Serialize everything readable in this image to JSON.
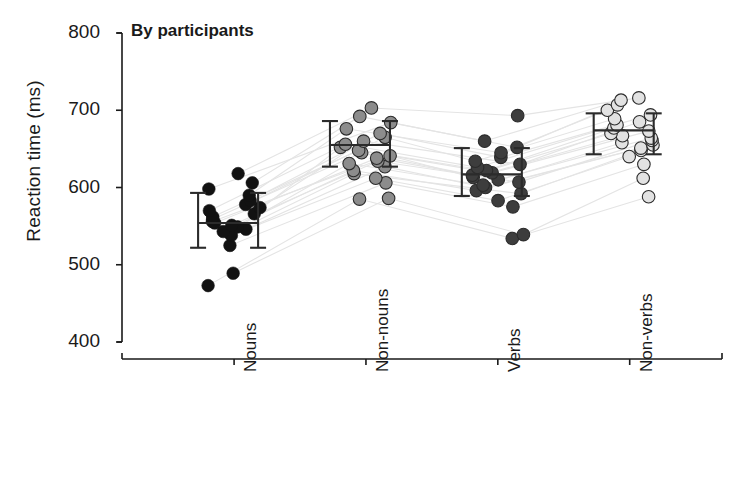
{
  "chart_data": {
    "type": "scatter",
    "title": "By participants",
    "xlabel": "",
    "ylabel": "Reaction time (ms)",
    "ylim": [
      400,
      800
    ],
    "yticks": [
      400,
      500,
      600,
      700,
      800
    ],
    "grid": false,
    "legend": "none",
    "categories": [
      "Nouns",
      "Non-nouns",
      "Verbs",
      "Non-verbs"
    ],
    "category_colors": [
      "#121212",
      "#8c8c8c",
      "#3d3d3d",
      "#e2e2e2"
    ],
    "connector_color": "#e4e4e4",
    "errorbar_color": "#2b2b2b",
    "means": [
      554,
      655,
      617,
      674
    ],
    "ci_low": [
      522,
      627,
      589,
      643
    ],
    "ci_high": [
      593,
      686,
      651,
      696
    ],
    "series": [
      {
        "name": "p1",
        "values": [
          473,
          585,
          534,
          588
        ]
      },
      {
        "name": "p2",
        "values": [
          489,
          586,
          539,
          612
        ]
      },
      {
        "name": "p3",
        "values": [
          525,
          606,
          575,
          630
        ]
      },
      {
        "name": "p4",
        "values": [
          538,
          612,
          583,
          640
        ]
      },
      {
        "name": "p5",
        "values": [
          540,
          618,
          592,
          648
        ]
      },
      {
        "name": "p6",
        "values": [
          543,
          622,
          596,
          651
        ]
      },
      {
        "name": "p7",
        "values": [
          546,
          627,
          600,
          655
        ]
      },
      {
        "name": "p8",
        "values": [
          549,
          631,
          603,
          658
        ]
      },
      {
        "name": "p9",
        "values": [
          551,
          634,
          607,
          661
        ]
      },
      {
        "name": "p10",
        "values": [
          554,
          638,
          610,
          664
        ]
      },
      {
        "name": "p11",
        "values": [
          556,
          641,
          613,
          667
        ]
      },
      {
        "name": "p12",
        "values": [
          559,
          645,
          616,
          670
        ]
      },
      {
        "name": "p13",
        "values": [
          562,
          648,
          619,
          673
        ]
      },
      {
        "name": "p14",
        "values": [
          566,
          652,
          622,
          677
        ]
      },
      {
        "name": "p15",
        "values": [
          570,
          656,
          626,
          681
        ]
      },
      {
        "name": "p16",
        "values": [
          574,
          660,
          630,
          685
        ]
      },
      {
        "name": "p17",
        "values": [
          578,
          665,
          634,
          689
        ]
      },
      {
        "name": "p18",
        "values": [
          583,
          670,
          639,
          694
        ]
      },
      {
        "name": "p19",
        "values": [
          590,
          676,
          645,
          700
        ]
      },
      {
        "name": "p20",
        "values": [
          598,
          684,
          652,
          707
        ]
      },
      {
        "name": "p21",
        "values": [
          606,
          692,
          660,
          713
        ]
      },
      {
        "name": "p22",
        "values": [
          618,
          703,
          693,
          716
        ]
      }
    ],
    "points": {
      "Nouns": [
        473,
        489,
        525,
        538,
        540,
        543,
        546,
        549,
        551,
        554,
        556,
        559,
        562,
        566,
        570,
        574,
        578,
        583,
        590,
        598,
        606,
        618
      ],
      "Non-nouns": [
        585,
        586,
        606,
        612,
        618,
        622,
        627,
        631,
        634,
        638,
        641,
        645,
        648,
        652,
        656,
        660,
        665,
        670,
        676,
        684,
        692,
        703
      ],
      "Verbs": [
        534,
        539,
        575,
        583,
        592,
        596,
        600,
        603,
        607,
        610,
        613,
        616,
        619,
        622,
        626,
        630,
        634,
        639,
        645,
        652,
        660,
        693
      ],
      "Non-verbs": [
        588,
        612,
        630,
        640,
        648,
        651,
        655,
        658,
        661,
        664,
        667,
        670,
        673,
        677,
        681,
        685,
        689,
        694,
        700,
        707,
        713,
        716
      ]
    }
  }
}
